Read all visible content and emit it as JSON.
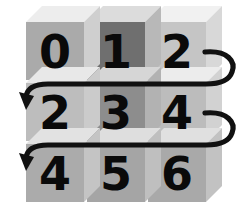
{
  "figure": {
    "background_color": "#ffffff",
    "width": 241,
    "height": 223
  },
  "grid": {
    "rows": 3,
    "cols": 3,
    "origin_x": 26,
    "origin_y": 22,
    "cell_width": 58,
    "cell_height": 58,
    "gap": 3,
    "depth_x": 16,
    "depth_y": 16,
    "cells": [
      {
        "id": "cell-r0-c0",
        "row": 0,
        "col": 0,
        "label": "0",
        "face_color": "#aaaaaa",
        "top_color": "#ededed",
        "side_color": "#cfcfcf"
      },
      {
        "id": "cell-r0-c1",
        "row": 0,
        "col": 1,
        "label": "1",
        "face_color": "#6f6f6f",
        "top_color": "#dcdcdc",
        "side_color": "#b8b8b8"
      },
      {
        "id": "cell-r0-c2",
        "row": 0,
        "col": 2,
        "label": "2",
        "face_color": "#c5c5c5",
        "top_color": "#f1f1f1",
        "side_color": "#d8d8d8"
      },
      {
        "id": "cell-r1-c0",
        "row": 1,
        "col": 0,
        "label": "2",
        "face_color": "#bdbdbd",
        "top_color": "#e8e8e8",
        "side_color": "#cbcbcb"
      },
      {
        "id": "cell-r1-c1",
        "row": 1,
        "col": 1,
        "label": "3",
        "face_color": "#8d8d8d",
        "top_color": "#d6d6d6",
        "side_color": "#b2b2b2"
      },
      {
        "id": "cell-r1-c2",
        "row": 1,
        "col": 2,
        "label": "4",
        "face_color": "#bcbcbc",
        "top_color": "#ececec",
        "side_color": "#d2d2d2"
      },
      {
        "id": "cell-r2-c0",
        "row": 2,
        "col": 0,
        "label": "4",
        "face_color": "#ababab",
        "top_color": "#e2e2e2",
        "side_color": "#c4c4c4"
      },
      {
        "id": "cell-r2-c1",
        "row": 2,
        "col": 1,
        "label": "5",
        "face_color": "#a5a5a5",
        "top_color": "#dedede",
        "side_color": "#bfbfbf"
      },
      {
        "id": "cell-r2-c2",
        "row": 2,
        "col": 2,
        "label": "6",
        "face_color": "#a9a9a9",
        "top_color": "#e0e0e0",
        "side_color": "#c2c2c2"
      }
    ]
  },
  "arrows": {
    "color": "#111111",
    "stroke_width": 5.2,
    "items": [
      {
        "id": "wrap-arrow-row0-to-row1",
        "from_label": "2",
        "to_label": "2",
        "from_row": 0,
        "to_row": 1,
        "description": "wraps right of row 0 around to start of row 1",
        "path": "M 205 52 C 228 50 236 62 232 72 C 229 81 218 84 206 84 L 48 84 C 34 84 27 88 26 97",
        "head_points": "26,110 19,92 34,96"
      },
      {
        "id": "wrap-arrow-row1-to-row2",
        "from_label": "4",
        "to_label": "4",
        "from_row": 1,
        "to_row": 2,
        "description": "wraps right of row 1 around to start of row 2",
        "path": "M 205 113 C 228 111 236 123 232 133 C 229 142 218 145 206 145 L 48 145 C 34 145 27 149 26 158",
        "head_points": "26,171 19,153 34,157"
      }
    ]
  },
  "sequence": {
    "order": [
      "0",
      "1",
      "2",
      "2",
      "3",
      "4",
      "4",
      "5",
      "6"
    ]
  }
}
